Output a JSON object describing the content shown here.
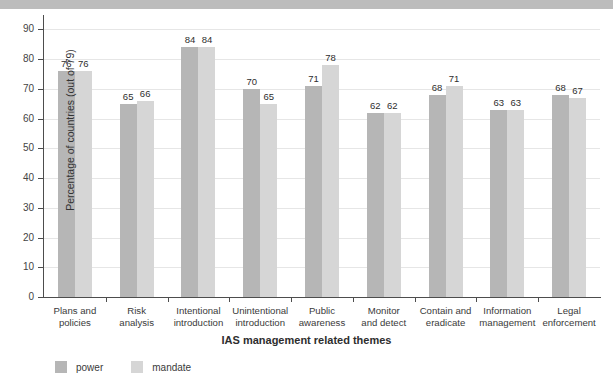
{
  "titlebar": {
    "cut_text": ""
  },
  "legend": {
    "position": "bottom-left",
    "entries": [
      {
        "label": "power",
        "color": "#b6b6b6"
      },
      {
        "label": "mandate",
        "color": "#d6d6d6"
      }
    ]
  },
  "chart_data": {
    "type": "bar",
    "title": "",
    "xlabel": "IAS management related themes",
    "ylabel": "Percentage of countries (out of 79)",
    "ylim": [
      0,
      93.5
    ],
    "yticks": [
      0,
      10,
      20,
      30,
      40,
      50,
      60,
      70,
      80,
      90
    ],
    "grid": true,
    "categories": [
      "Plans and policies",
      "Risk analysis",
      "Intentional introduction",
      "Unintentional introduction",
      "Public awareness",
      "Monitor and detect",
      "Contain and eradicate",
      "Information management",
      "Legal enforcement"
    ],
    "category_lines": [
      [
        "Plans and",
        "policies"
      ],
      [
        "Risk",
        "analysis"
      ],
      [
        "Intentional",
        "introduction"
      ],
      [
        "Unintentional",
        "introduction"
      ],
      [
        "Public",
        "awareness"
      ],
      [
        "Monitor",
        "and detect"
      ],
      [
        "Contain and",
        "eradicate"
      ],
      [
        "Information",
        "management"
      ],
      [
        "Legal",
        "enforcement"
      ]
    ],
    "series": [
      {
        "name": "power",
        "color": "#b6b6b6",
        "values": [
          76,
          65,
          84,
          70,
          71,
          62,
          68,
          63,
          68
        ]
      },
      {
        "name": "mandate",
        "color": "#d6d6d6",
        "values": [
          76,
          66,
          84,
          65,
          78,
          62,
          71,
          63,
          67
        ]
      }
    ]
  }
}
